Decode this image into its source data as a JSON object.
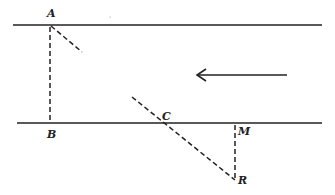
{
  "diagram": {
    "labels": {
      "A": "A",
      "B": "B",
      "C": "C",
      "M": "M",
      "R": "R"
    },
    "points": {
      "A": [
        50,
        25
      ],
      "B": [
        50,
        123
      ],
      "C": [
        163,
        123
      ],
      "M": [
        235,
        123
      ],
      "R": [
        235,
        180
      ]
    },
    "lines": {
      "top_line": {
        "x1": 13,
        "y1": 25,
        "x2": 322,
        "y2": 25,
        "style": "solid"
      },
      "bottom_line": {
        "x1": 17,
        "y1": 123,
        "x2": 322,
        "y2": 123,
        "style": "solid"
      },
      "AB": {
        "style": "dashed"
      },
      "A_diag": {
        "x1": 50,
        "y1": 25,
        "x2": 82,
        "y2": 52,
        "style": "dashed"
      },
      "CR_diag": {
        "x1": 132,
        "y1": 97,
        "x2": 235,
        "y2": 180,
        "style": "dashed"
      },
      "MR": {
        "style": "dashed"
      }
    },
    "arrow": {
      "x1": 287,
      "y1": 75,
      "x2": 197,
      "y2": 75,
      "direction": "left"
    },
    "colors": {
      "ink": "#222222",
      "background": "#ffffff"
    }
  }
}
